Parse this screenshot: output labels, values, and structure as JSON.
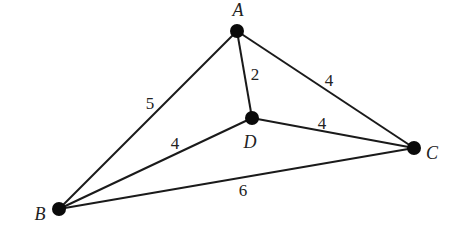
{
  "diagram": {
    "type": "weighted-graph",
    "nodes": [
      {
        "id": "A",
        "label": "A",
        "x": 237,
        "y": 31,
        "label_x": 238,
        "label_y": 16
      },
      {
        "id": "B",
        "label": "B",
        "x": 59,
        "y": 209,
        "label_x": 40,
        "label_y": 220
      },
      {
        "id": "C",
        "label": "C",
        "x": 414,
        "y": 148,
        "label_x": 432,
        "label_y": 159
      },
      {
        "id": "D",
        "label": "D",
        "x": 252,
        "y": 118,
        "label_x": 250,
        "label_y": 148
      }
    ],
    "edges": [
      {
        "from": "A",
        "to": "B",
        "weight": "5",
        "label_x": 150,
        "label_y": 109
      },
      {
        "from": "A",
        "to": "D",
        "weight": "2",
        "label_x": 255,
        "label_y": 80
      },
      {
        "from": "A",
        "to": "C",
        "weight": "4",
        "label_x": 329,
        "label_y": 86
      },
      {
        "from": "B",
        "to": "D",
        "weight": "4",
        "label_x": 175,
        "label_y": 149
      },
      {
        "from": "D",
        "to": "C",
        "weight": "4",
        "label_x": 322,
        "label_y": 129
      },
      {
        "from": "B",
        "to": "C",
        "weight": "6",
        "label_x": 243,
        "label_y": 196
      }
    ]
  },
  "labels": {
    "A": "A",
    "B": "B",
    "C": "C",
    "D": "D",
    "w_AB": "5",
    "w_AD": "2",
    "w_AC": "4",
    "w_BD": "4",
    "w_DC": "4",
    "w_BC": "6"
  },
  "colors": {
    "edge": "#1a1a1a",
    "node": "#0a0a0a",
    "text": "#222222",
    "background": "#ffffff"
  }
}
